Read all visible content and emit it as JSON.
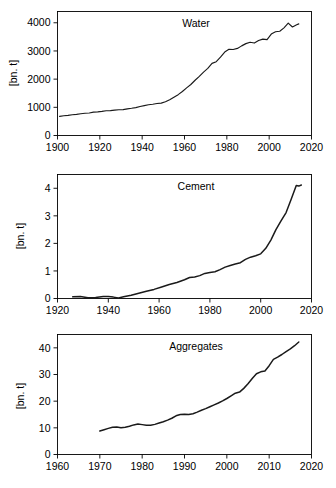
{
  "figure": {
    "background_color": "#ffffff",
    "line_color": "#1a1a1a",
    "axis_color": "#000000",
    "panel_count": 3
  },
  "chart_data": [
    {
      "type": "line",
      "title": "Water",
      "xlabel": "",
      "ylabel": "[bn. t]",
      "xlim": [
        1900,
        2020
      ],
      "ylim": [
        0,
        4400
      ],
      "xticks": [
        1900,
        1920,
        1940,
        1960,
        1980,
        2000,
        2020
      ],
      "xticklabels": [
        "1900",
        "1920",
        "1940",
        "1960",
        "1980",
        "2000",
        "2020"
      ],
      "yticks": [
        0,
        1000,
        2000,
        3000,
        4000
      ],
      "yticklabels": [
        "0",
        "1000",
        "2000",
        "3000",
        "4000"
      ],
      "grid": false,
      "legend": "none",
      "x": [
        1901,
        1903,
        1905,
        1907,
        1909,
        1911,
        1913,
        1915,
        1917,
        1919,
        1921,
        1923,
        1925,
        1927,
        1929,
        1931,
        1933,
        1935,
        1937,
        1939,
        1941,
        1943,
        1945,
        1947,
        1949,
        1951,
        1953,
        1955,
        1957,
        1959,
        1961,
        1963,
        1965,
        1967,
        1969,
        1971,
        1973,
        1975,
        1977,
        1979,
        1981,
        1983,
        1985,
        1987,
        1989,
        1991,
        1993,
        1995,
        1997,
        1999,
        2001,
        2003,
        2005,
        2007,
        2009,
        2011,
        2013,
        2014
      ],
      "y": [
        680,
        700,
        715,
        735,
        750,
        770,
        790,
        800,
        830,
        840,
        855,
        880,
        885,
        900,
        915,
        920,
        945,
        965,
        990,
        1030,
        1060,
        1090,
        1110,
        1135,
        1150,
        1195,
        1270,
        1360,
        1450,
        1560,
        1690,
        1810,
        1960,
        2100,
        2250,
        2380,
        2560,
        2620,
        2780,
        2960,
        3060,
        3050,
        3090,
        3180,
        3260,
        3310,
        3280,
        3370,
        3420,
        3400,
        3600,
        3680,
        3700,
        3820,
        3990,
        3850,
        3930,
        3960
      ]
    },
    {
      "type": "line",
      "title": "Cement",
      "xlabel": "",
      "ylabel": "[bn. t]",
      "xlim": [
        1920,
        2020
      ],
      "ylim": [
        0,
        4.5
      ],
      "xticks": [
        1920,
        1940,
        1960,
        1980,
        2000,
        2020
      ],
      "xticklabels": [
        "1920",
        "1940",
        "1960",
        "1980",
        "2000",
        "2020"
      ],
      "yticks": [
        0,
        1,
        2,
        3,
        4
      ],
      "yticklabels": [
        "0",
        "1",
        "2",
        "3",
        "4"
      ],
      "grid": false,
      "legend": "none",
      "x": [
        1926,
        1929,
        1932,
        1935,
        1938,
        1940,
        1942,
        1944,
        1946,
        1949,
        1952,
        1955,
        1958,
        1961,
        1964,
        1967,
        1970,
        1972,
        1974,
        1976,
        1978,
        1980,
        1982,
        1984,
        1986,
        1988,
        1990,
        1992,
        1994,
        1996,
        1998,
        2000,
        2002,
        2004,
        2006,
        2008,
        2010,
        2012,
        2014,
        2015,
        2016
      ],
      "y": [
        0.06,
        0.07,
        0.03,
        0.04,
        0.07,
        0.07,
        0.05,
        0.02,
        0.06,
        0.12,
        0.19,
        0.26,
        0.33,
        0.42,
        0.51,
        0.58,
        0.68,
        0.76,
        0.78,
        0.83,
        0.91,
        0.94,
        0.97,
        1.05,
        1.14,
        1.2,
        1.25,
        1.3,
        1.42,
        1.5,
        1.55,
        1.62,
        1.82,
        2.12,
        2.5,
        2.82,
        3.12,
        3.6,
        4.1,
        4.08,
        4.12
      ]
    },
    {
      "type": "line",
      "title": "Aggregates",
      "xlabel": "",
      "ylabel": "[bn. t]",
      "xlim": [
        1960,
        2020
      ],
      "ylim": [
        0,
        45
      ],
      "xticks": [
        1960,
        1970,
        1980,
        1990,
        2000,
        2010,
        2020
      ],
      "xticklabels": [
        "1960",
        "1970",
        "1980",
        "1990",
        "2000",
        "2010",
        "2020"
      ],
      "yticks": [
        0,
        10,
        20,
        30,
        40
      ],
      "yticklabels": [
        "0",
        "10",
        "20",
        "30",
        "40"
      ],
      "grid": false,
      "legend": "none",
      "x": [
        1970,
        1971,
        1972,
        1973,
        1974,
        1975,
        1976,
        1977,
        1978,
        1979,
        1980,
        1981,
        1982,
        1983,
        1984,
        1985,
        1986,
        1987,
        1988,
        1989,
        1990,
        1991,
        1992,
        1993,
        1994,
        1995,
        1996,
        1997,
        1998,
        1999,
        2000,
        2001,
        2002,
        2003,
        2004,
        2005,
        2006,
        2007,
        2008,
        2009,
        2010,
        2011,
        2012,
        2013,
        2014,
        2015,
        2016,
        2017
      ],
      "y": [
        8.8,
        9.3,
        9.8,
        10.2,
        10.3,
        10.0,
        10.2,
        10.6,
        11.1,
        11.4,
        11.2,
        11.0,
        11.0,
        11.3,
        11.8,
        12.3,
        12.9,
        13.6,
        14.5,
        15.0,
        15.1,
        15.0,
        15.3,
        15.9,
        16.6,
        17.2,
        17.9,
        18.6,
        19.3,
        20.1,
        21.0,
        22.0,
        23.0,
        23.4,
        24.8,
        26.5,
        28.5,
        30.3,
        31.0,
        31.3,
        33.3,
        35.7,
        36.5,
        37.5,
        38.6,
        39.6,
        40.8,
        42.2
      ]
    }
  ]
}
